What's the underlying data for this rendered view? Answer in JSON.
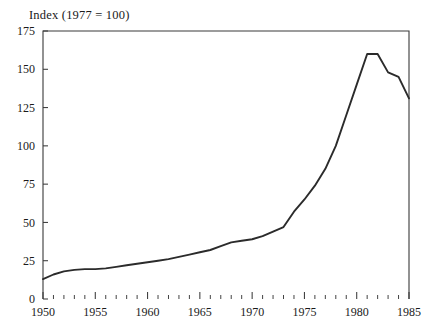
{
  "chart_data": {
    "type": "line",
    "title": "Index (1977 =  100)",
    "xlabel": "",
    "ylabel": "",
    "xlim": [
      1950,
      1985
    ],
    "ylim": [
      0,
      175
    ],
    "grid": false,
    "legend": "none",
    "x_ticks": [
      1950,
      1955,
      1960,
      1965,
      1970,
      1975,
      1980,
      1985
    ],
    "x_tick_labels": [
      "1950",
      "1955",
      "1960",
      "1965",
      "1970",
      "1975",
      "1980",
      "1985"
    ],
    "x_minor_tick_interval": 1,
    "y_ticks": [
      0,
      25,
      50,
      75,
      100,
      125,
      150,
      175
    ],
    "y_tick_labels": [
      "0",
      "25",
      "50",
      "75",
      "100",
      "125",
      "150",
      "175"
    ],
    "line_color": "#2b2b2b",
    "frame_color": "#3a3a3a",
    "x": [
      1950,
      1951,
      1952,
      1953,
      1954,
      1955,
      1956,
      1957,
      1958,
      1959,
      1960,
      1961,
      1962,
      1963,
      1964,
      1965,
      1966,
      1967,
      1968,
      1969,
      1970,
      1971,
      1972,
      1973,
      1974,
      1975,
      1976,
      1977,
      1978,
      1979,
      1980,
      1981,
      1982,
      1983,
      1984,
      1985
    ],
    "values": [
      13,
      16,
      18,
      19,
      19.5,
      19.5,
      20,
      21,
      22,
      23,
      24,
      25,
      26,
      27.5,
      29,
      30.5,
      32,
      34.5,
      37,
      38,
      39,
      41,
      44,
      47,
      57,
      65,
      74,
      85,
      100,
      120,
      140,
      160,
      160,
      148,
      145,
      131
    ],
    "annotations": []
  },
  "axis": {
    "title": "Index (1977 =  100)"
  }
}
